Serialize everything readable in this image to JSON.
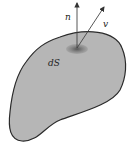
{
  "diagram": {
    "labels": {
      "normal": "n",
      "velocity": "v",
      "surface_element": "dS"
    },
    "colors": {
      "surface_fill": "#b4b4b4",
      "outline": "#2a2a2a",
      "patch": "#6e6e6e",
      "arrow": "#444444"
    }
  }
}
